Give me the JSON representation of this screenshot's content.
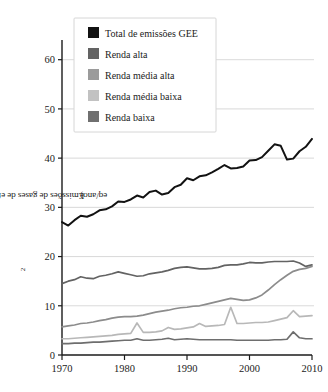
{
  "chart_data": {
    "type": "line",
    "title": "",
    "xlabel": "",
    "ylabel": "Emissões de gases de efeito estufa (GtCO₂ eq/ano)",
    "ylabel_parts": {
      "prefix": "Emissões de gases de efeito estufa (GtCO",
      "subscript": "2",
      "suffix": " eq/ano)"
    },
    "xlim": [
      1970,
      2010
    ],
    "ylim": [
      0,
      64
    ],
    "xticks": [
      1970,
      1980,
      1990,
      2000,
      2010
    ],
    "yticks": [
      0,
      10,
      20,
      30,
      40,
      50,
      60
    ],
    "xtick_labels": [
      "1970",
      "1980",
      "1990",
      "2000",
      "2010"
    ],
    "ytick_labels": [
      "0",
      "10",
      "20",
      "30",
      "40",
      "50",
      "60"
    ],
    "grid": "horizontal",
    "grid_color": "#cfcfcf",
    "legend_position": "top-left",
    "x": [
      1970,
      1971,
      1972,
      1973,
      1974,
      1975,
      1976,
      1977,
      1978,
      1979,
      1980,
      1981,
      1982,
      1983,
      1984,
      1985,
      1986,
      1987,
      1988,
      1989,
      1990,
      1991,
      1992,
      1993,
      1994,
      1995,
      1996,
      1997,
      1998,
      1999,
      2000,
      2001,
      2002,
      2003,
      2004,
      2005,
      2006,
      2007,
      2008,
      2009,
      2010
    ],
    "series": [
      {
        "name": "Total de emissões GEE",
        "color": "#121212",
        "width": 2.0,
        "values": [
          27.0,
          26.3,
          27.4,
          28.3,
          28.1,
          28.6,
          29.4,
          29.6,
          30.2,
          31.2,
          31.1,
          31.6,
          32.4,
          32.0,
          33.1,
          33.4,
          32.6,
          32.9,
          34.1,
          34.6,
          35.9,
          35.5,
          36.3,
          36.5,
          37.1,
          37.8,
          38.6,
          37.9,
          38.0,
          38.3,
          39.5,
          39.6,
          40.2,
          41.5,
          42.8,
          42.5,
          39.7,
          39.9,
          41.4,
          42.3,
          43.9
        ]
      },
      {
        "name": "Renda alta",
        "color": "#636363",
        "width": 1.7,
        "values": [
          14.5,
          15.0,
          15.3,
          15.9,
          15.6,
          15.5,
          16.0,
          16.2,
          16.5,
          16.9,
          16.6,
          16.3,
          16.0,
          16.1,
          16.5,
          16.7,
          16.9,
          17.2,
          17.6,
          17.8,
          17.9,
          17.7,
          17.5,
          17.5,
          17.6,
          17.8,
          18.2,
          18.3,
          18.3,
          18.5,
          18.8,
          18.7,
          18.7,
          18.9,
          19.0,
          19.0,
          19.0,
          19.1,
          18.7,
          18.0,
          18.3
        ]
      },
      {
        "name": "Renda média alta",
        "color": "#8c8c8c",
        "width": 1.7,
        "values": [
          5.7,
          5.9,
          6.1,
          6.4,
          6.5,
          6.7,
          7.0,
          7.2,
          7.5,
          7.7,
          7.8,
          7.8,
          7.9,
          8.1,
          8.4,
          8.7,
          8.9,
          9.1,
          9.4,
          9.6,
          9.7,
          9.9,
          10.0,
          10.3,
          10.6,
          10.9,
          11.2,
          11.5,
          11.3,
          11.1,
          11.2,
          11.6,
          12.2,
          13.2,
          14.3,
          15.3,
          16.2,
          17.0,
          17.4,
          17.6,
          18.0
        ]
      },
      {
        "name": "Renda média baixa",
        "color": "#b8b8b8",
        "width": 1.7,
        "values": [
          3.3,
          3.3,
          3.4,
          3.5,
          3.6,
          3.7,
          3.8,
          3.9,
          4.0,
          4.2,
          4.3,
          4.4,
          6.5,
          4.6,
          4.6,
          4.7,
          4.9,
          5.6,
          5.2,
          5.3,
          5.5,
          5.7,
          6.4,
          5.8,
          5.9,
          6.0,
          6.2,
          9.7,
          6.4,
          6.4,
          6.5,
          6.6,
          6.6,
          6.7,
          7.0,
          7.3,
          7.6,
          9.0,
          7.8,
          7.9,
          8.0
        ]
      },
      {
        "name": "Renda baixa",
        "color": "#6e6e6e",
        "width": 1.7,
        "values": [
          2.3,
          2.3,
          2.4,
          2.4,
          2.5,
          2.6,
          2.6,
          2.7,
          2.8,
          2.9,
          3.0,
          3.0,
          3.3,
          3.0,
          3.0,
          3.1,
          3.2,
          3.4,
          3.1,
          3.2,
          3.3,
          3.2,
          3.1,
          3.1,
          3.1,
          3.1,
          3.1,
          3.1,
          3.0,
          3.0,
          3.0,
          3.0,
          3.0,
          3.0,
          3.1,
          3.1,
          3.2,
          4.7,
          3.5,
          3.3,
          3.3
        ]
      }
    ]
  },
  "legend": {
    "items": [
      {
        "label": "Total de emissões GEE",
        "color": "#121212"
      },
      {
        "label": "Renda alta",
        "color": "#636363"
      },
      {
        "label": "Renda média alta",
        "color": "#9b9b9b"
      },
      {
        "label": "Renda média baixa",
        "color": "#c2c2c2"
      },
      {
        "label": "Renda baixa",
        "color": "#707070"
      }
    ],
    "border_color": "#d6d6d6",
    "background": "#ffffff"
  }
}
